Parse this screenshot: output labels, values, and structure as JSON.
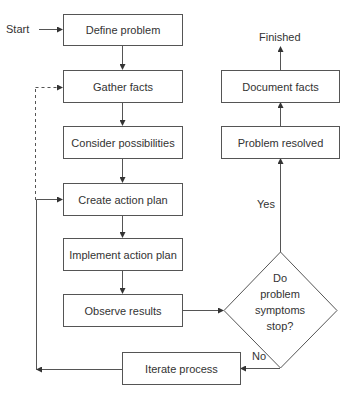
{
  "diagram": {
    "type": "flowchart",
    "colors": {
      "stroke": "#555555",
      "text": "#333333",
      "background": "#ffffff"
    },
    "labels": {
      "start": "Start",
      "finished": "Finished",
      "yes": "Yes",
      "no": "No"
    },
    "nodes": {
      "define_problem": "Define problem",
      "gather_facts": "Gather facts",
      "consider_possibilities": "Consider possibilities",
      "create_action_plan": "Create action plan",
      "implement_action_plan": "Implement action plan",
      "observe_results": "Observe results",
      "iterate_process": "Iterate process",
      "problem_resolved": "Problem resolved",
      "document_facts": "Document facts"
    },
    "decision": {
      "lines": [
        "Do",
        "problem",
        "symptoms",
        "stop?"
      ]
    },
    "edges": [
      {
        "from": "Start",
        "to": "Define problem"
      },
      {
        "from": "Define problem",
        "to": "Gather facts"
      },
      {
        "from": "Gather facts",
        "to": "Consider possibilities"
      },
      {
        "from": "Consider possibilities",
        "to": "Create action plan"
      },
      {
        "from": "Create action plan",
        "to": "Implement action plan"
      },
      {
        "from": "Implement action plan",
        "to": "Observe results"
      },
      {
        "from": "Observe results",
        "to": "Do problem symptoms stop?"
      },
      {
        "from": "Do problem symptoms stop?",
        "to": "Problem resolved",
        "label": "Yes"
      },
      {
        "from": "Problem resolved",
        "to": "Document facts"
      },
      {
        "from": "Document facts",
        "to": "Finished"
      },
      {
        "from": "Do problem symptoms stop?",
        "to": "Iterate process",
        "label": "No"
      },
      {
        "from": "Iterate process",
        "to": "Create action plan",
        "style": "solid"
      },
      {
        "from": "Iterate process",
        "to": "Gather facts",
        "style": "dashed"
      }
    ]
  }
}
